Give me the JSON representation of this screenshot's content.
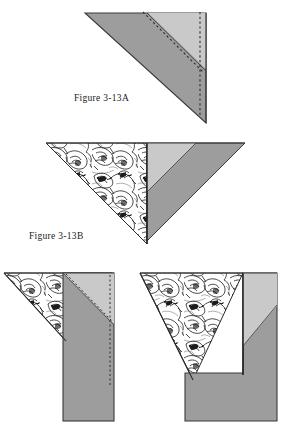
{
  "document": {
    "type": "sewing-instruction-diagram",
    "page_background": "#ffffff"
  },
  "labels": {
    "figure_a": "Figure 3-13A",
    "figure_b": "Figure 3-13B"
  },
  "colors": {
    "fabric_gray": "#9d9d9d",
    "fabric_light_gray": "#c9c9c9",
    "outline": "#3a3a3a",
    "dashed_stitch": "#2b2b2b",
    "print_ink": "#1c1c1c",
    "paper_white": "#ffffff",
    "text": "#1a1a1a"
  },
  "figures": [
    {
      "id": "figure-a",
      "name": "folded-triangle-with-seam-allowance",
      "label": "Figure 3-13A",
      "description": "Gray right triangle, point down-right, with a narrow light gray seam allowance band along the upper-right side and two dashed stitching lines",
      "shapes": [
        {
          "name": "main-gray-triangle",
          "fill": "#9d9d9d"
        },
        {
          "name": "light-gray-seam-band",
          "fill": "#c9c9c9"
        },
        {
          "name": "diagonal-dashed-stitch-line",
          "stroke": "#2b2b2b"
        },
        {
          "name": "vertical-dashed-stitch-line",
          "stroke": "#2b2b2b"
        }
      ]
    },
    {
      "id": "figure-b",
      "name": "opened-triangle-print-and-gray",
      "label": "Figure 3-13B",
      "description": "Left half is a printed floral fabric triangle, right half is a gray triangle with light gray diagonal band; together they form a downward-pointing triangle",
      "shapes": [
        {
          "name": "printed-floral-triangle",
          "fill": "floral-print"
        },
        {
          "name": "gray-triangle-right",
          "fill": "#9d9d9d"
        },
        {
          "name": "light-gray-band",
          "fill": "#c9c9c9"
        }
      ]
    },
    {
      "id": "figure-c",
      "name": "triangle-with-gray-tab-folded-down",
      "label": "",
      "description": "Printed floral triangle on the left with a long gray rectangular tab extending downward, marked with diagonal and vertical dashed stitching lines",
      "shapes": [
        {
          "name": "printed-floral-triangle",
          "fill": "floral-print"
        },
        {
          "name": "gray-tab-rectangle",
          "fill": "#9d9d9d"
        },
        {
          "name": "light-gray-corner",
          "fill": "#c9c9c9"
        },
        {
          "name": "diagonal-dashed-stitch-line",
          "stroke": "#2b2b2b"
        },
        {
          "name": "vertical-dashed-stitch-line",
          "stroke": "#2b2b2b"
        }
      ]
    },
    {
      "id": "figure-d",
      "name": "triangle-with-gray-block-right",
      "label": "",
      "description": "Printed floral triangle on the left with a solid gray block on the right side extending downward, light gray angled corner at top",
      "shapes": [
        {
          "name": "printed-floral-triangle",
          "fill": "floral-print"
        },
        {
          "name": "gray-block",
          "fill": "#9d9d9d"
        },
        {
          "name": "light-gray-corner",
          "fill": "#c9c9c9"
        }
      ]
    }
  ]
}
